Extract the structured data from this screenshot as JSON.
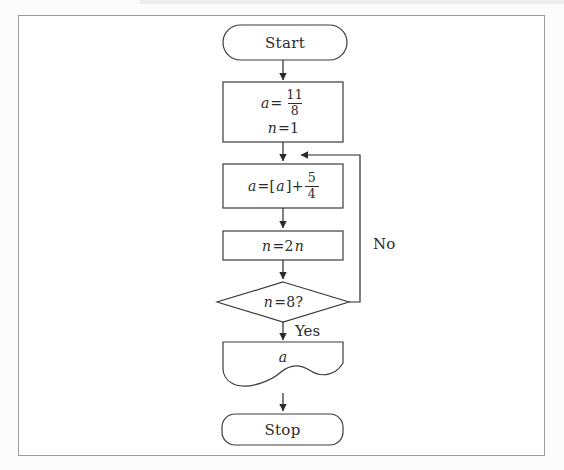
{
  "colors": {
    "ink": "#2b2b2b",
    "shape_stroke": "#3c3c3c",
    "frame_border": "#9b9b9b",
    "background": "#ffffff"
  },
  "flowchart": {
    "start_label": "Start",
    "stop_label": "Stop",
    "yes_label": "Yes",
    "no_label": "No",
    "init_box": {
      "var_a": "a",
      "eq": "=",
      "frac_num": "11",
      "frac_den": "8",
      "var_n": "n",
      "n_rest": "=1"
    },
    "assign_box": {
      "var_a": "a",
      "open": "=[",
      "var_a2": "a",
      "close": "]+",
      "frac_num": "5",
      "frac_den": "4"
    },
    "double_box": {
      "var_n": "n",
      "mid": "=2",
      "var_n2": "n"
    },
    "decision": {
      "var_n": "n",
      "rest": "=8?"
    },
    "output_box": {
      "var_a": "a"
    }
  }
}
